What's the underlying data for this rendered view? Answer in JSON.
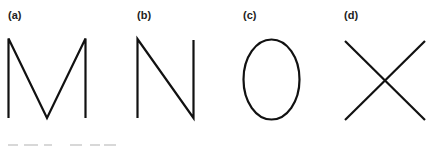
{
  "figure": {
    "panels": [
      {
        "id": "a",
        "label": "(a)",
        "letter": "M",
        "shape": "letter-M-strokes"
      },
      {
        "id": "b",
        "label": "(b)",
        "letter": "N",
        "shape": "letter-N-strokes"
      },
      {
        "id": "c",
        "label": "(c)",
        "letter": "O",
        "shape": "ellipse-outline"
      },
      {
        "id": "d",
        "label": "(d)",
        "letter": "X",
        "shape": "crossed-lines"
      }
    ],
    "stroke_color": "#111111",
    "label_color": "#222222",
    "background": "#ffffff",
    "bottom_row": {
      "note": "next row of panel labels cropped at bottom edge, unreadable"
    }
  }
}
